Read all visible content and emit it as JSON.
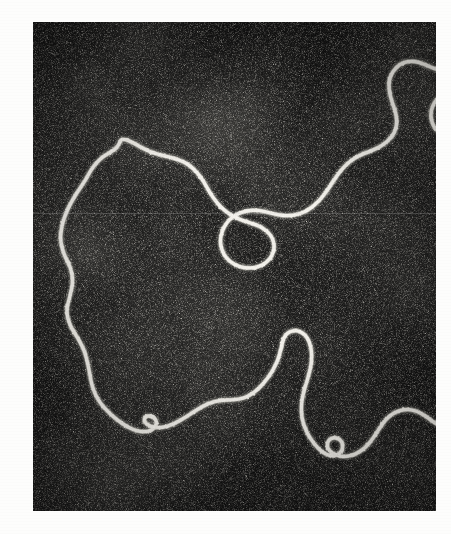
{
  "figure": {
    "kind": "electron-micrograph",
    "modality": "dark-field transmission electron micrograph",
    "specimen": "circular DNA molecule (relaxed / open-circular plasmid)",
    "caption": "",
    "label": "",
    "scale_bar": "",
    "annotations": []
  },
  "plate": {
    "x": 33,
    "y": 22,
    "width": 403,
    "height": 489,
    "background_color": "#0d0d0d",
    "filament_color": "#f2f0ea",
    "page_color": "#fdfdfc",
    "grain_density": 0.42,
    "grain_brightness": 0.55,
    "scanline_y": 191
  },
  "contour": {
    "description": "Single continuous closed DNA duplex forming one large irregular loop with an internal fold, plus a small twisted lobe at lower right",
    "stroke_width_px": 3.4,
    "closed": true,
    "segments": [
      {
        "name": "main-loop",
        "points": [
          [
            176,
            236
          ],
          [
            168,
            252
          ],
          [
            152,
            262
          ],
          [
            136,
            272
          ],
          [
            118,
            292
          ],
          [
            104,
            318
          ],
          [
            86,
            344
          ],
          [
            70,
            372
          ],
          [
            58,
            404
          ],
          [
            54,
            436
          ],
          [
            62,
            466
          ],
          [
            76,
            492
          ],
          [
            80,
            520
          ],
          [
            74,
            548
          ],
          [
            66,
            578
          ],
          [
            74,
            608
          ],
          [
            90,
            632
          ],
          [
            104,
            660
          ],
          [
            112,
            694
          ],
          [
            118,
            730
          ],
          [
            132,
            760
          ],
          [
            156,
            786
          ],
          [
            182,
            806
          ],
          [
            206,
            818
          ],
          [
            228,
            820
          ],
          [
            244,
            812
          ],
          [
            248,
            798
          ],
          [
            238,
            788
          ],
          [
            224,
            788
          ],
          [
            222,
            800
          ],
          [
            236,
            810
          ],
          [
            258,
            812
          ],
          [
            282,
            804
          ],
          [
            306,
            790
          ],
          [
            330,
            774
          ],
          [
            352,
            762
          ],
          [
            376,
            756
          ],
          [
            400,
            756
          ],
          [
            424,
            752
          ],
          [
            444,
            740
          ],
          [
            462,
            722
          ],
          [
            478,
            700
          ],
          [
            490,
            676
          ],
          [
            496,
            654
          ],
          [
            500,
            634
          ],
          [
            510,
            620
          ],
          [
            528,
            616
          ],
          [
            546,
            626
          ],
          [
            556,
            648
          ],
          [
            558,
            676
          ],
          [
            552,
            706
          ],
          [
            542,
            736
          ],
          [
            536,
            766
          ],
          [
            538,
            796
          ],
          [
            548,
            822
          ],
          [
            562,
            844
          ],
          [
            578,
            860
          ],
          [
            594,
            868
          ],
          [
            610,
            866
          ],
          [
            620,
            854
          ],
          [
            618,
            838
          ],
          [
            604,
            830
          ],
          [
            590,
            836
          ],
          [
            588,
            852
          ],
          [
            600,
            864
          ],
          [
            620,
            870
          ],
          [
            642,
            866
          ],
          [
            662,
            854
          ],
          [
            678,
            836
          ],
          [
            692,
            814
          ],
          [
            706,
            794
          ],
          [
            724,
            780
          ],
          [
            746,
            774
          ],
          [
            768,
            778
          ],
          [
            788,
            790
          ],
          [
            806,
            804
          ],
          [
            824,
            812
          ],
          [
            842,
            810
          ],
          [
            858,
            796
          ],
          [
            868,
            774
          ],
          [
            872,
            748
          ],
          [
            868,
            720
          ],
          [
            858,
            694
          ],
          [
            846,
            670
          ],
          [
            840,
            646
          ],
          [
            842,
            624
          ],
          [
            854,
            606
          ],
          [
            872,
            594
          ],
          [
            892,
            588
          ],
          [
            908,
            576
          ],
          [
            918,
            558
          ],
          [
            920,
            534
          ],
          [
            914,
            508
          ],
          [
            904,
            482
          ],
          [
            894,
            456
          ],
          [
            888,
            428
          ],
          [
            888,
            400
          ],
          [
            894,
            372
          ],
          [
            904,
            346
          ],
          [
            914,
            322
          ],
          [
            918,
            298
          ],
          [
            914,
            274
          ],
          [
            902,
            254
          ],
          [
            884,
            240
          ],
          [
            862,
            232
          ],
          [
            840,
            230
          ],
          [
            820,
            226
          ],
          [
            804,
            214
          ],
          [
            796,
            196
          ],
          [
            796,
            176
          ],
          [
            804,
            158
          ],
          [
            818,
            144
          ],
          [
            836,
            136
          ],
          [
            856,
            134
          ],
          [
            876,
            138
          ],
          [
            894,
            146
          ],
          [
            912,
            152
          ],
          [
            930,
            152
          ],
          [
            946,
            146
          ],
          [
            958,
            134
          ],
          [
            962,
            118
          ],
          [
            956,
            102
          ],
          [
            942,
            92
          ],
          [
            922,
            88
          ],
          [
            900,
            90
          ],
          [
            878,
            96
          ],
          [
            856,
            100
          ],
          [
            832,
            100
          ],
          [
            810,
            96
          ],
          [
            790,
            88
          ],
          [
            772,
            80
          ],
          [
            752,
            78
          ],
          [
            734,
            84
          ],
          [
            720,
            98
          ],
          [
            712,
            116
          ],
          [
            712,
            138
          ],
          [
            718,
            160
          ],
          [
            726,
            182
          ],
          [
            728,
            204
          ],
          [
            722,
            224
          ],
          [
            708,
            240
          ],
          [
            690,
            252
          ],
          [
            670,
            260
          ],
          [
            650,
            268
          ],
          [
            632,
            280
          ],
          [
            616,
            296
          ],
          [
            602,
            316
          ],
          [
            588,
            338
          ],
          [
            572,
            358
          ],
          [
            554,
            374
          ],
          [
            534,
            384
          ],
          [
            512,
            388
          ],
          [
            490,
            386
          ],
          [
            468,
            380
          ],
          [
            446,
            376
          ],
          [
            424,
            378
          ],
          [
            404,
            386
          ],
          [
            388,
            400
          ],
          [
            378,
            418
          ],
          [
            374,
            438
          ],
          [
            378,
            458
          ],
          [
            388,
            474
          ],
          [
            404,
            486
          ],
          [
            422,
            492
          ],
          [
            442,
            492
          ],
          [
            460,
            486
          ],
          [
            474,
            474
          ],
          [
            482,
            458
          ],
          [
            482,
            440
          ],
          [
            474,
            424
          ],
          [
            460,
            412
          ],
          [
            442,
            404
          ],
          [
            422,
            398
          ],
          [
            402,
            390
          ],
          [
            384,
            378
          ],
          [
            368,
            362
          ],
          [
            354,
            342
          ],
          [
            342,
            320
          ],
          [
            328,
            300
          ],
          [
            310,
            284
          ],
          [
            288,
            274
          ],
          [
            264,
            268
          ],
          [
            240,
            262
          ],
          [
            218,
            252
          ],
          [
            198,
            240
          ],
          [
            182,
            234
          ]
        ]
      }
    ]
  }
}
